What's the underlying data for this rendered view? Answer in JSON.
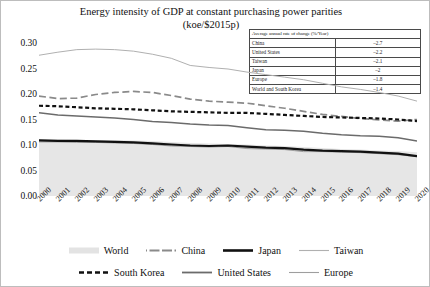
{
  "title": {
    "line1": "Energy intensity of GDP at constant purchasing power parities",
    "line2": "(koe/$2015p)"
  },
  "rate_table": {
    "header": "Average annual rate of change (%/Year)",
    "rows": [
      {
        "name": "China",
        "value": "–2.7"
      },
      {
        "name": "United States",
        "value": "–2.2"
      },
      {
        "name": "Taiwan",
        "value": "–2.1"
      },
      {
        "name": "Japan",
        "value": "–2"
      },
      {
        "name": "Europe",
        "value": "–1.8"
      },
      {
        "name": "World and South Korea",
        "value": "–1.4"
      }
    ]
  },
  "legend": {
    "row1": [
      {
        "label": "World",
        "style": "area",
        "color": "#e3e3e3"
      },
      {
        "label": "China",
        "style": "dashdot",
        "color": "#8a8a8a"
      },
      {
        "label": "Japan",
        "style": "solid-thick",
        "color": "#111111"
      },
      {
        "label": "Taiwan",
        "style": "solid-thin",
        "color": "#b0b0b0"
      }
    ],
    "row2": [
      {
        "label": "South Korea",
        "style": "dashed",
        "color": "#111111"
      },
      {
        "label": "United States",
        "style": "solid-med",
        "color": "#6b6b6b"
      },
      {
        "label": "Europe",
        "style": "solid-thin",
        "color": "#9e9e9e"
      }
    ]
  },
  "yticks": [
    "0.00",
    "0.05",
    "0.10",
    "0.15",
    "0.20",
    "0.25",
    "0.30"
  ],
  "chart_data": {
    "type": "line",
    "title": "Energy intensity of GDP at constant purchasing power parities (koe/$2015p)",
    "xlabel": "",
    "ylabel": "",
    "ylim": [
      0.0,
      0.3
    ],
    "xlim": [
      2000,
      2020
    ],
    "grid": false,
    "legend_position": "bottom",
    "categories": [
      "2000",
      "2001",
      "2002",
      "2003",
      "2004",
      "2005",
      "2006",
      "2007",
      "2008",
      "2009",
      "2010",
      "2011",
      "2012",
      "2013",
      "2014",
      "2015",
      "2016",
      "2017",
      "2018",
      "2019",
      "2020"
    ],
    "series": [
      {
        "name": "World",
        "style": "area",
        "color": "#e6e6e6",
        "values": [
          0.112,
          0.111,
          0.11,
          0.11,
          0.11,
          0.109,
          0.108,
          0.106,
          0.104,
          0.103,
          0.102,
          0.101,
          0.099,
          0.098,
          0.096,
          0.094,
          0.092,
          0.091,
          0.089,
          0.088,
          0.086
        ]
      },
      {
        "name": "China",
        "style": "dashdot",
        "color": "#8a8a8a",
        "values": [
          0.196,
          0.191,
          0.192,
          0.199,
          0.203,
          0.205,
          0.203,
          0.197,
          0.19,
          0.186,
          0.184,
          0.182,
          0.177,
          0.172,
          0.166,
          0.16,
          0.156,
          0.152,
          0.149,
          0.147,
          0.15
        ]
      },
      {
        "name": "Japan",
        "style": "solid-thick",
        "color": "#111111",
        "values": [
          0.109,
          0.108,
          0.108,
          0.107,
          0.106,
          0.105,
          0.103,
          0.101,
          0.099,
          0.098,
          0.099,
          0.097,
          0.095,
          0.094,
          0.091,
          0.089,
          0.088,
          0.087,
          0.085,
          0.083,
          0.078
        ]
      },
      {
        "name": "Taiwan",
        "style": "solid-thin",
        "color": "#b0b0b0",
        "values": [
          0.276,
          0.282,
          0.287,
          0.288,
          0.287,
          0.284,
          0.278,
          0.27,
          0.256,
          0.252,
          0.249,
          0.243,
          0.238,
          0.233,
          0.228,
          0.221,
          0.214,
          0.209,
          0.203,
          0.196,
          0.186
        ]
      },
      {
        "name": "South Korea",
        "style": "dashed",
        "color": "#111111",
        "values": [
          0.177,
          0.176,
          0.174,
          0.172,
          0.171,
          0.17,
          0.168,
          0.166,
          0.165,
          0.164,
          0.163,
          0.163,
          0.161,
          0.159,
          0.157,
          0.155,
          0.154,
          0.153,
          0.152,
          0.15,
          0.147
        ]
      },
      {
        "name": "United States",
        "style": "solid-med",
        "color": "#6b6b6b",
        "values": [
          0.163,
          0.159,
          0.157,
          0.155,
          0.153,
          0.15,
          0.146,
          0.144,
          0.141,
          0.139,
          0.138,
          0.134,
          0.13,
          0.129,
          0.127,
          0.123,
          0.12,
          0.118,
          0.117,
          0.114,
          0.108
        ]
      },
      {
        "name": "Europe",
        "style": "solid-thin",
        "color": "#9e9e9e",
        "values": [
          0.106,
          0.106,
          0.105,
          0.105,
          0.104,
          0.103,
          0.101,
          0.098,
          0.097,
          0.096,
          0.097,
          0.093,
          0.092,
          0.091,
          0.087,
          0.087,
          0.086,
          0.085,
          0.083,
          0.081,
          0.077
        ]
      }
    ]
  }
}
